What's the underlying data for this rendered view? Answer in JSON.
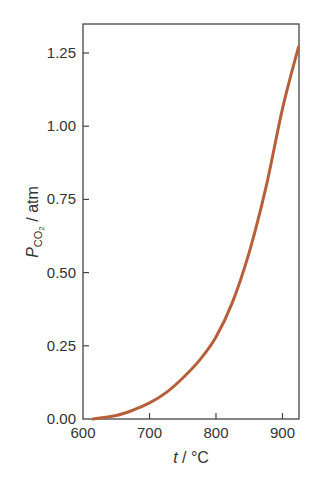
{
  "chart_data": {
    "type": "line",
    "title": "",
    "xlabel": "t / °C",
    "ylabel": "P_CO2 / atm",
    "xlim": [
      600,
      924
    ],
    "ylim": [
      0,
      1.32
    ],
    "xticks": [
      600,
      700,
      800,
      900
    ],
    "xtick_labels": [
      "600",
      "700",
      "800",
      "900"
    ],
    "yticks": [
      0,
      0.25,
      0.5,
      0.75,
      1.0,
      1.25
    ],
    "ytick_labels": [
      "0.00",
      "0.25",
      "0.50",
      "0.75",
      "1.00",
      "1.25"
    ],
    "grid": false,
    "legend": null,
    "series": [
      {
        "name": "P_CO2",
        "color": "#b5603a",
        "x": [
          615,
          650,
          675,
          700,
          725,
          750,
          775,
          800,
          825,
          850,
          875,
          900,
          924
        ],
        "y": [
          0.0,
          0.012,
          0.03,
          0.055,
          0.09,
          0.14,
          0.2,
          0.28,
          0.4,
          0.57,
          0.79,
          1.06,
          1.27
        ]
      }
    ]
  },
  "labels": {
    "xlabel_italic": "t",
    "xlabel_rest": " / °C",
    "ylabel_main": "P",
    "ylabel_sub": "CO",
    "ylabel_subsub": "2",
    "ylabel_rest": " / atm"
  }
}
